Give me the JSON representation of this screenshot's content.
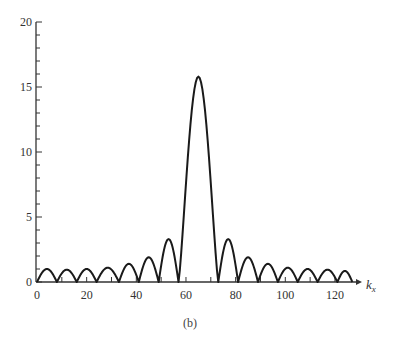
{
  "chart_data": {
    "type": "line",
    "title": "",
    "caption": "(b)",
    "xlabel": "k_x",
    "xlabel_main": "k",
    "xlabel_sub": "x",
    "ylabel": "",
    "xlim": [
      0,
      128
    ],
    "ylim": [
      0,
      20
    ],
    "xticks": [
      0,
      20,
      40,
      60,
      80,
      100,
      120
    ],
    "yticks": [
      0,
      5,
      10,
      15,
      20
    ],
    "grid": false,
    "legend": null,
    "series": [
      {
        "name": "magnitude",
        "lobes": [
          {
            "start": 0,
            "end": 8,
            "peak": 1.0
          },
          {
            "start": 8,
            "end": 16,
            "peak": 0.95
          },
          {
            "start": 16,
            "end": 24,
            "peak": 1.0
          },
          {
            "start": 24,
            "end": 33,
            "peak": 1.1
          },
          {
            "start": 33,
            "end": 41,
            "peak": 1.4
          },
          {
            "start": 41,
            "end": 49,
            "peak": 1.9
          },
          {
            "start": 49,
            "end": 57,
            "peak": 3.3
          },
          {
            "start": 57,
            "end": 73,
            "peak": 15.8
          },
          {
            "start": 73,
            "end": 81,
            "peak": 3.3
          },
          {
            "start": 81,
            "end": 89,
            "peak": 1.9
          },
          {
            "start": 89,
            "end": 97,
            "peak": 1.4
          },
          {
            "start": 97,
            "end": 105,
            "peak": 1.1
          },
          {
            "start": 105,
            "end": 113,
            "peak": 1.0
          },
          {
            "start": 113,
            "end": 121,
            "peak": 0.95
          },
          {
            "start": 121,
            "end": 127,
            "peak": 0.85
          }
        ]
      }
    ]
  }
}
